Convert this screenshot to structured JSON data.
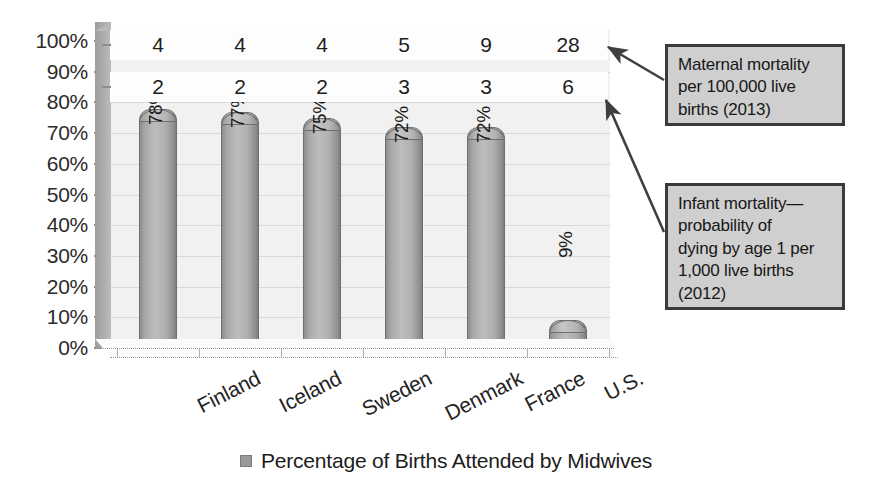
{
  "chart_data": {
    "type": "bar",
    "title": "",
    "subtitle": "",
    "xlabel": "",
    "ylabel": "",
    "ylim": [
      0,
      100
    ],
    "grid": true,
    "legend_position": "bottom",
    "categories": [
      "Finland",
      "Iceland",
      "Sweden",
      "Denmark",
      "France",
      "U.S."
    ],
    "series": [
      {
        "name": "Percentage of Births Attended by Midwives",
        "values": [
          78,
          77,
          75,
          72,
          72,
          9
        ],
        "labels": [
          "78%",
          "77%",
          "75%",
          "72%",
          "72%",
          "9%"
        ]
      }
    ],
    "data_table_rows": [
      {
        "name": "Maternal mortality per 100,000 live births (2013)",
        "values": [
          4,
          4,
          4,
          5,
          9,
          28
        ]
      },
      {
        "name": "Infant mortality—probability of dying by age 1 per 1,000 live births (2012)",
        "values": [
          2,
          2,
          2,
          3,
          3,
          6
        ]
      }
    ],
    "ytick_labels": [
      "100%",
      "90%",
      "80%",
      "70%",
      "60%",
      "50%",
      "40%",
      "30%",
      "20%",
      "10%",
      "0%"
    ],
    "ytick_values": [
      100,
      90,
      80,
      70,
      60,
      50,
      40,
      30,
      20,
      10,
      0
    ],
    "annotations": [
      "Maternal mortality per 100,000 live births (2013)",
      "Infant mortality—probability of dying by age 1 per 1,000 live births (2012)"
    ]
  },
  "legend": {
    "label": "Percentage of Births Attended by Midwives",
    "swatch_color": "#9a9a9a"
  },
  "callouts": {
    "maternal": {
      "lines": [
        "Maternal mortality",
        "per 100,000 live",
        "births (2013)"
      ],
      "text": "Maternal mortality per 100,000 live births (2013)"
    },
    "infant": {
      "lines": [
        "Infant mortality—",
        "probability of",
        "dying by age 1 per",
        "1,000 live births",
        "(2012)"
      ],
      "text": "Infant mortality—probability of dying by age 1 per 1,000 live births (2012)"
    }
  },
  "colors": {
    "plot_background": "#f1f1f1",
    "bar_fill": "#b0b0b0",
    "bar_edge": "#6f6f6f",
    "callout_fill": "#cfcfcf",
    "callout_border": "#3a3a3a",
    "gridline": "#d8d8d8",
    "text": "#1a1a1a"
  }
}
